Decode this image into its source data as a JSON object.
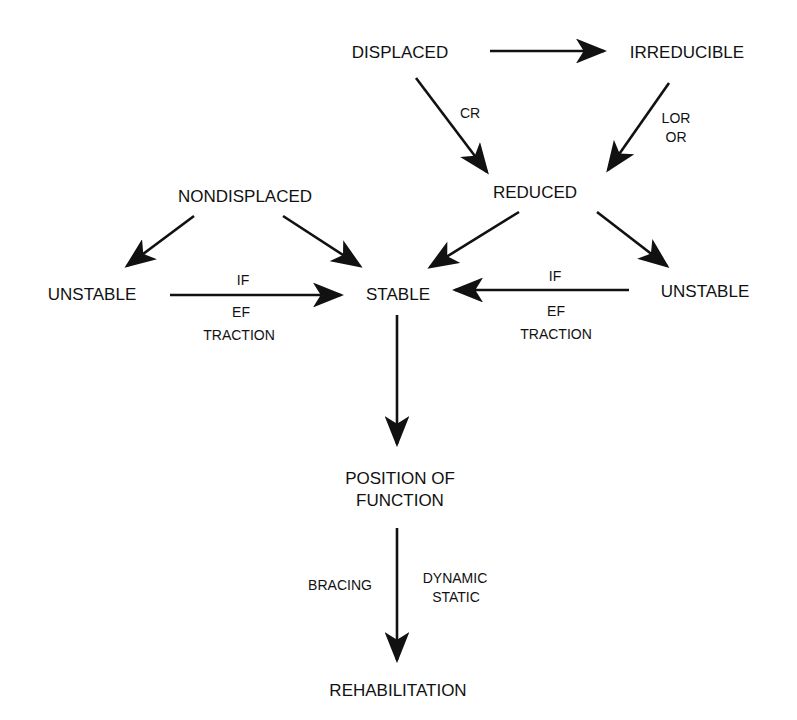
{
  "diagram": {
    "type": "flowchart",
    "nodes": {
      "displaced": "DISPLACED",
      "irreducible": "IRREDUCIBLE",
      "reduced": "REDUCED",
      "nondisplaced": "NONDISPLACED",
      "unstable_left": "UNSTABLE",
      "stable": "STABLE",
      "unstable_right": "UNSTABLE",
      "position_line1": "POSITION OF",
      "position_line2": "FUNCTION",
      "rehabilitation": "REHABILITATION"
    },
    "edge_labels": {
      "displaced_to_reduced": "CR",
      "irreducible_to_reduced_1": "LOR",
      "irreducible_to_reduced_2": "OR",
      "left_unstable_to_stable_above": "IF",
      "left_unstable_to_stable_below_1": "EF",
      "left_unstable_to_stable_below_2": "TRACTION",
      "right_unstable_to_stable_above": "IF",
      "right_unstable_to_stable_below_1": "EF",
      "right_unstable_to_stable_below_2": "TRACTION",
      "position_to_rehab_left": "BRACING",
      "position_to_rehab_right_1": "DYNAMIC",
      "position_to_rehab_right_2": "STATIC"
    },
    "edges": [
      {
        "from": "DISPLACED",
        "to": "IRREDUCIBLE",
        "label": ""
      },
      {
        "from": "DISPLACED",
        "to": "REDUCED",
        "label": "CR"
      },
      {
        "from": "IRREDUCIBLE",
        "to": "REDUCED",
        "label": "LOR / OR"
      },
      {
        "from": "NONDISPLACED",
        "to": "UNSTABLE (left)",
        "label": ""
      },
      {
        "from": "NONDISPLACED",
        "to": "STABLE",
        "label": ""
      },
      {
        "from": "REDUCED",
        "to": "STABLE",
        "label": ""
      },
      {
        "from": "REDUCED",
        "to": "UNSTABLE (right)",
        "label": ""
      },
      {
        "from": "UNSTABLE (left)",
        "to": "STABLE",
        "label": "IF / EF / TRACTION"
      },
      {
        "from": "UNSTABLE (right)",
        "to": "STABLE",
        "label": "IF / EF / TRACTION"
      },
      {
        "from": "STABLE",
        "to": "POSITION OF FUNCTION",
        "label": ""
      },
      {
        "from": "POSITION OF FUNCTION",
        "to": "REHABILITATION",
        "label": "BRACING | DYNAMIC / STATIC"
      }
    ],
    "colors": {
      "ink": "#111111",
      "background": "#ffffff"
    }
  }
}
